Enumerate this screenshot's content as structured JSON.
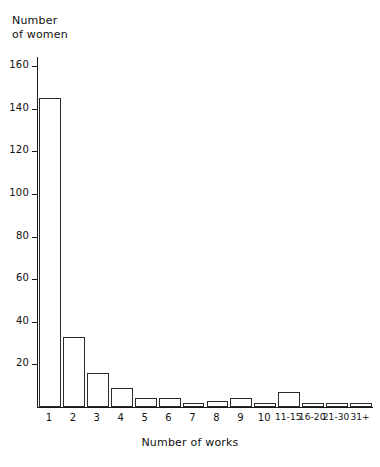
{
  "chart_data": {
    "type": "bar",
    "title": "",
    "xlabel": "Number of works",
    "ylabel": "Number of women",
    "categories": [
      "1",
      "2",
      "3",
      "4",
      "5",
      "6",
      "7",
      "8",
      "9",
      "10",
      "11-15",
      "16-20",
      "21-30",
      "31+"
    ],
    "values": [
      145,
      33,
      16,
      9,
      4,
      4,
      2,
      3,
      4,
      2,
      7,
      2,
      2,
      2
    ],
    "ylim": [
      0,
      168
    ],
    "yticks": [
      20,
      40,
      60,
      80,
      100,
      120,
      140,
      160
    ],
    "ytick_labels": [
      "20",
      "40",
      "60",
      "80",
      "100",
      "120",
      "140",
      "160"
    ],
    "grid": false,
    "legend": null,
    "bar_fill": "#ffffff",
    "bar_edge": "#2a2a2a",
    "axis_color": "#1a1a1a"
  }
}
